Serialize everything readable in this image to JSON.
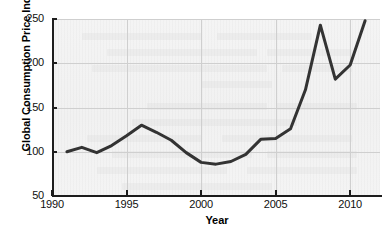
{
  "chart_data": {
    "type": "line",
    "title": "",
    "xlabel": "Year",
    "ylabel": "Global Consumption Price Index",
    "xlim": [
      1990,
      2012
    ],
    "ylim": [
      50,
      250
    ],
    "xticks": [
      1990,
      1995,
      2000,
      2005,
      2010
    ],
    "xtick_labels": [
      "1990",
      "1995",
      "2000",
      "2005",
      "2010"
    ],
    "yticks": [
      50,
      100,
      150,
      200,
      250
    ],
    "ytick_labels": [
      "50",
      "100",
      "150",
      "200",
      "250"
    ],
    "grid": true,
    "legend": false,
    "line_color": "#333333",
    "line_width": 3,
    "x": [
      1991,
      1992,
      1993,
      1994,
      1995,
      1996,
      1997,
      1998,
      1999,
      2000,
      2001,
      2002,
      2003,
      2004,
      2005,
      2006,
      2007,
      2008,
      2009,
      2010,
      2011
    ],
    "values": [
      100,
      105,
      99,
      107,
      118,
      130,
      122,
      113,
      99,
      88,
      86,
      89,
      97,
      114,
      115,
      126,
      170,
      243,
      182,
      198,
      248
    ],
    "series": [
      {
        "name": "Global Consumption Price Index",
        "values": [
          100,
          105,
          99,
          107,
          118,
          130,
          122,
          113,
          99,
          88,
          86,
          89,
          97,
          114,
          115,
          126,
          170,
          243,
          182,
          198,
          248
        ]
      }
    ],
    "annotations": []
  },
  "figure": {
    "background_color": "#ffffff",
    "plot_background_color": "#f2f2f2",
    "axis_color": "#1d1d1d",
    "grid_color": "#cfcfcf"
  }
}
